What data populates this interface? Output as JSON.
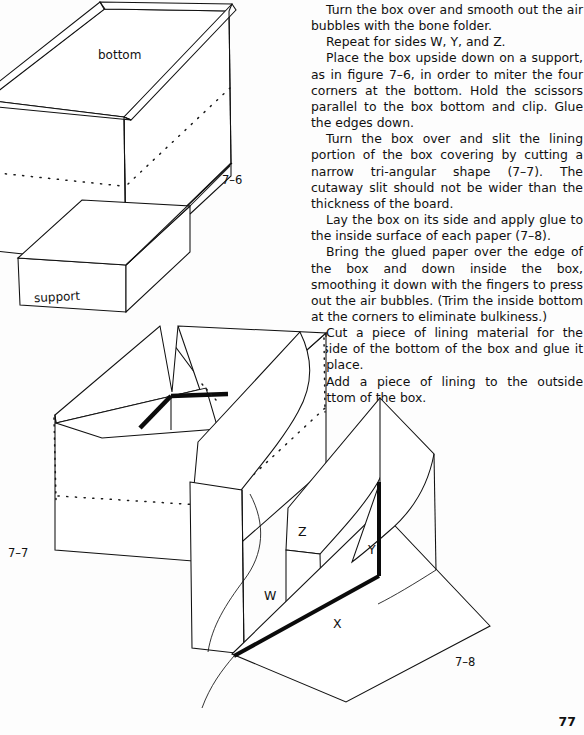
{
  "page": {
    "number": "77",
    "width": 584,
    "height": 735
  },
  "text_column": {
    "paragraphs": [
      "Turn the box over and smooth out the air bubbles with the bone folder.",
      "Repeat for sides W, Y, and Z.",
      "Place the box upside down on a support, as in figure 7–6, in order to miter the four corners at the bottom. Hold the scissors parallel to the box bottom and clip. Glue the edges down.",
      "Turn the box over and slit the lining portion of the box covering by cutting a narrow tri-angular shape (7–7). The cutaway slit should not be wider than the thickness of the board.",
      "Lay the box on its side and apply glue to the inside surface of each paper (7–8).",
      "Bring the glued paper over the edge of the box and down inside the box, smoothing it down with the fingers to press out the air bubbles. (Trim the inside bottom at the corners to eliminate bulkiness.)",
      "Cut a piece of lining material for the inside of the bottom of the box and glue it in place.",
      "Add a piece of lining to the outside bottom of the box."
    ]
  },
  "figures": [
    {
      "id": "fig-7-6",
      "caption": "7–6",
      "description": "Box shown upside down resting on a support block, bottom face upward",
      "labels": {
        "bottom": "bottom",
        "support": "support"
      }
    },
    {
      "id": "fig-7-7",
      "caption": "7–7",
      "description": "Open box with a narrow triangular cutaway slit in the lining at the inside corner"
    },
    {
      "id": "fig-7-8",
      "caption": "7–8",
      "description": "Box lying on its side with lining papers W, X, Y and Z extended outward for gluing",
      "faces": {
        "w": "W",
        "x": "X",
        "y": "Y",
        "z": "Z"
      }
    }
  ],
  "colors": {
    "paper": "#fdfdfd",
    "ink": "#111111",
    "bold_edge": "#0b0b0b",
    "dotted_guide": "#1a1a1a"
  }
}
